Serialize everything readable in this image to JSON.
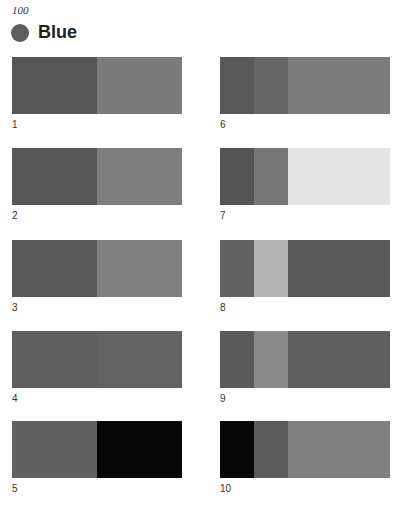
{
  "header": {
    "page_number": "100",
    "title": "Blue",
    "dot_color": "#5e5e5e"
  },
  "swatches": [
    {
      "label": "1",
      "segments": [
        {
          "w": 50,
          "color": "#565656"
        },
        {
          "w": 50,
          "color": "#7b7b7b"
        }
      ]
    },
    {
      "label": "2",
      "segments": [
        {
          "w": 50,
          "color": "#575757"
        },
        {
          "w": 50,
          "color": "#7e7e7e"
        }
      ]
    },
    {
      "label": "3",
      "segments": [
        {
          "w": 50,
          "color": "#595959"
        },
        {
          "w": 50,
          "color": "#808080"
        }
      ]
    },
    {
      "label": "4",
      "segments": [
        {
          "w": 50,
          "color": "#5e5e5e"
        },
        {
          "w": 50,
          "color": "#636363"
        }
      ]
    },
    {
      "label": "5",
      "segments": [
        {
          "w": 50,
          "color": "#616161"
        },
        {
          "w": 50,
          "color": "#070707"
        }
      ]
    },
    {
      "label": "6",
      "segments": [
        {
          "w": 20,
          "color": "#585858"
        },
        {
          "w": 20,
          "color": "#666666"
        },
        {
          "w": 60,
          "color": "#7d7d7d"
        }
      ]
    },
    {
      "label": "7",
      "segments": [
        {
          "w": 20,
          "color": "#545454"
        },
        {
          "w": 20,
          "color": "#777777"
        },
        {
          "w": 60,
          "color": "#e4e4e4"
        }
      ]
    },
    {
      "label": "8",
      "segments": [
        {
          "w": 20,
          "color": "#626262"
        },
        {
          "w": 20,
          "color": "#b4b4b4"
        },
        {
          "w": 60,
          "color": "#585858"
        }
      ]
    },
    {
      "label": "9",
      "segments": [
        {
          "w": 20,
          "color": "#5a5a5a"
        },
        {
          "w": 20,
          "color": "#8a8a8a"
        },
        {
          "w": 60,
          "color": "#5f5f5f"
        }
      ]
    },
    {
      "label": "10",
      "segments": [
        {
          "w": 20,
          "color": "#080808"
        },
        {
          "w": 20,
          "color": "#5c5c5c"
        },
        {
          "w": 60,
          "color": "#808080"
        }
      ]
    }
  ]
}
